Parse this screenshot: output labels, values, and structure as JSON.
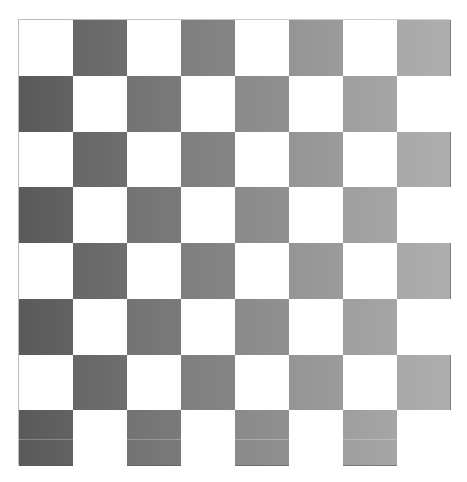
{
  "board": {
    "rows": 8,
    "cols": 8,
    "first_square": "light",
    "colors": {
      "light": "#ffffff",
      "dark_left": "#5a5a5a",
      "dark_right": "#a0a0a0",
      "border": "#bbbbbb"
    }
  }
}
